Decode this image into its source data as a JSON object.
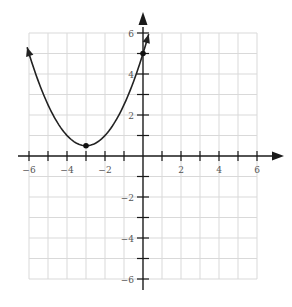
{
  "chart_data": {
    "type": "line",
    "title": "",
    "xlabel": "",
    "ylabel": "",
    "xlim": [
      -6,
      6
    ],
    "ylim": [
      -6,
      6
    ],
    "grid": true,
    "x_tick_labels": [
      "-6",
      "-4",
      "-2",
      "2",
      "4",
      "6"
    ],
    "y_tick_labels": [
      "6",
      "4",
      "2",
      "-2",
      "-4",
      "-6"
    ],
    "series": [
      {
        "name": "parabola",
        "equation": "y = 0.5(x+3)^2 + 0.5",
        "x": [
          -6.1,
          -5,
          -4,
          -3,
          -2,
          -1,
          0,
          0.3
        ],
        "values": [
          5.3,
          2.5,
          1.0,
          0.5,
          1.0,
          2.5,
          5.0,
          5.9
        ],
        "arrows_at_ends": true
      }
    ],
    "points": [
      {
        "label": "vertex",
        "x": -3,
        "y": 0.5
      },
      {
        "label": "y-intercept",
        "x": 0,
        "y": 5
      }
    ]
  },
  "colors": {
    "curve": "#222222",
    "axis": "#1a1a1a",
    "grid": "#d9d9d9"
  }
}
